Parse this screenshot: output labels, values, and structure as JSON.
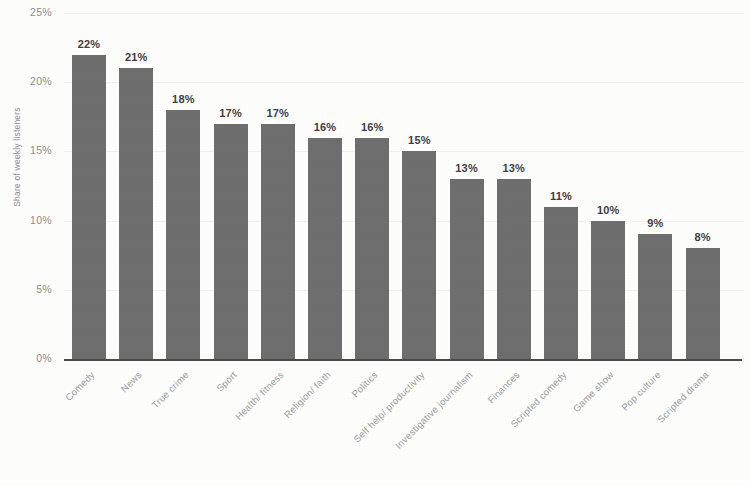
{
  "chart_data": {
    "type": "bar",
    "title": "",
    "subtitle": "",
    "xlabel": "",
    "ylabel": "Share of weekly listeners",
    "ylim": [
      0,
      25
    ],
    "ytick_labels": [
      "25%",
      "20%",
      "15%",
      "10%",
      "5%",
      "0%"
    ],
    "yticks": [
      25,
      20,
      15,
      10,
      5,
      0
    ],
    "grid": true,
    "legend": null,
    "value_label_suffix": "%",
    "bar_color": "#6e6e6e",
    "axis_color": "#4a4a4a",
    "categories": [
      "Comedy",
      "News",
      "True crime",
      "Sport",
      "Health/ fitness",
      "Religion/ faith",
      "Politics",
      "Self help/ productivity",
      "Investigative journalism",
      "Finances",
      "Scripted comedy",
      "Game show",
      "Pop culture",
      "Scripted drama"
    ],
    "values": [
      22,
      21,
      18,
      17,
      17,
      16,
      16,
      15,
      13,
      13,
      11,
      10,
      9,
      8
    ],
    "value_labels": [
      "22%",
      "21%",
      "18%",
      "17%",
      "17%",
      "16%",
      "16%",
      "15%",
      "13%",
      "13%",
      "11%",
      "10%",
      "9%",
      "8%"
    ]
  }
}
